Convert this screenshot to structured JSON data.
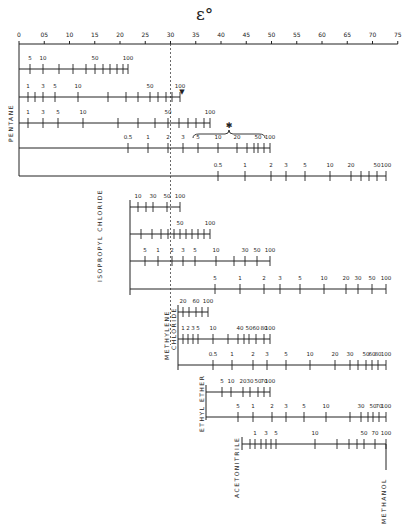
{
  "title": "ε°",
  "axis": {
    "min": 0,
    "max": 0.75,
    "step": 0.05,
    "ticks": [
      "0",
      "05",
      "10",
      "15",
      "20",
      "25",
      "30",
      "35",
      "40",
      "45",
      "50",
      "55",
      "60",
      "65",
      "70",
      "75"
    ],
    "x0_px": 19,
    "px_per_unit": 505,
    "y_px": 44
  },
  "reference_line": {
    "value": 0.3,
    "style": "dashed"
  },
  "solvent_labels": [
    {
      "id": "pentane",
      "text": "PENTANE",
      "x": 7,
      "y": 142
    },
    {
      "id": "isopropyl-chloride",
      "text": "ISOPROPYL  CHLORIDE",
      "x": 96,
      "y": 282
    },
    {
      "id": "methylene-chloride-1",
      "text": "METHYLENE",
      "x": 163,
      "y": 360
    },
    {
      "id": "methylene-chloride-2",
      "text": "CHLORIDE",
      "x": 170,
      "y": 350
    },
    {
      "id": "ethyl-ether",
      "text": "ETHYL  ETHER",
      "x": 198,
      "y": 432
    },
    {
      "id": "acetonitrile",
      "text": "ACETONITRILE",
      "x": 233,
      "y": 498
    },
    {
      "id": "methanol",
      "text": "METHANOL",
      "x": 380,
      "y": 524
    }
  ],
  "scales": [
    {
      "y": 69,
      "x1": 19,
      "x2": 128,
      "labels": [
        [
          "5",
          30
        ],
        [
          "10",
          43
        ],
        [
          "50",
          95
        ],
        [
          "100",
          128
        ]
      ],
      "ticks": [
        30,
        43,
        59,
        73,
        86,
        95,
        103,
        110,
        117,
        123,
        128
      ]
    },
    {
      "y": 97,
      "x1": 19,
      "x2": 180,
      "labels": [
        [
          "1",
          28
        ],
        [
          "3",
          43
        ],
        [
          "5",
          55
        ],
        [
          "10",
          78
        ],
        [
          "50",
          150
        ],
        [
          "100",
          180
        ]
      ],
      "ticks": [
        28,
        35,
        43,
        55,
        78,
        108,
        126,
        138,
        150,
        158,
        166,
        172,
        180
      ]
    },
    {
      "y": 123,
      "x1": 19,
      "x2": 210,
      "labels": [
        [
          "1",
          28
        ],
        [
          "3",
          43
        ],
        [
          "5",
          58
        ],
        [
          "10",
          83
        ],
        [
          "50",
          168
        ],
        [
          "100",
          210
        ]
      ],
      "ticks": [
        28,
        43,
        58,
        83,
        118,
        138,
        155,
        168,
        179,
        188,
        196,
        204,
        210
      ]
    },
    {
      "y": 148,
      "x1": 19,
      "x2": 270,
      "labels": [
        [
          "0.5",
          128
        ],
        [
          "1",
          148
        ],
        [
          "2",
          168
        ],
        [
          "3",
          183
        ],
        [
          "5",
          198
        ],
        [
          "10",
          218
        ],
        [
          "20",
          237
        ],
        [
          "50",
          258
        ],
        [
          "100",
          270
        ]
      ],
      "ticks": [
        128,
        148,
        168,
        183,
        198,
        218,
        237,
        247,
        254,
        258,
        264,
        270
      ],
      "brace": {
        "x1": 193,
        "x2": 265,
        "y": 133,
        "mark": "✱"
      }
    },
    {
      "y": 176,
      "x1": 19,
      "x2": 386,
      "labels": [
        [
          "0.5",
          218
        ],
        [
          "1",
          245
        ],
        [
          "2",
          271
        ],
        [
          "3",
          286
        ],
        [
          "5",
          305
        ],
        [
          "10",
          330
        ],
        [
          "20",
          351
        ],
        [
          "50",
          377
        ],
        [
          "100",
          386
        ]
      ],
      "ticks": [
        218,
        245,
        271,
        286,
        305,
        330,
        351,
        361,
        369,
        377,
        386
      ]
    },
    {
      "y": 207,
      "x1": 130,
      "x2": 180,
      "labels": [
        [
          "10",
          138
        ],
        [
          "30",
          153
        ],
        [
          "50",
          167
        ],
        [
          "100",
          180
        ]
      ],
      "ticks": [
        138,
        146,
        153,
        167,
        180
      ]
    },
    {
      "y": 234,
      "x1": 130,
      "x2": 210,
      "labels": [
        [
          "50",
          180
        ],
        [
          "100",
          210
        ]
      ],
      "ticks": [
        141,
        152,
        161,
        168,
        174,
        180,
        186,
        192,
        198,
        204,
        210
      ]
    },
    {
      "y": 261,
      "x1": 130,
      "x2": 270,
      "labels": [
        [
          "5",
          145
        ],
        [
          "1",
          158
        ],
        [
          "2",
          172
        ],
        [
          "3",
          183
        ],
        [
          "5",
          195
        ],
        [
          "10",
          216
        ],
        [
          "30",
          245
        ],
        [
          "50",
          257
        ],
        [
          "100",
          270
        ]
      ],
      "ticks": [
        145,
        158,
        172,
        183,
        195,
        216,
        234,
        245,
        257,
        270
      ]
    },
    {
      "y": 289,
      "x1": 130,
      "x2": 386,
      "labels": [
        [
          "5",
          215
        ],
        [
          "1",
          240
        ],
        [
          "2",
          264
        ],
        [
          "3",
          280
        ],
        [
          "5",
          300
        ],
        [
          "10",
          324
        ],
        [
          "20",
          346
        ],
        [
          "30",
          358
        ],
        [
          "50",
          372
        ],
        [
          "100",
          386
        ]
      ],
      "ticks": [
        215,
        240,
        264,
        280,
        300,
        324,
        346,
        358,
        372,
        386
      ]
    },
    {
      "y": 312,
      "x1": 178,
      "x2": 208,
      "labels": [
        [
          "20",
          183
        ],
        [
          "60",
          196
        ],
        [
          "100",
          208
        ]
      ],
      "ticks": [
        183,
        189,
        196,
        202,
        208
      ]
    },
    {
      "y": 339,
      "x1": 178,
      "x2": 270,
      "labels": [
        [
          "1",
          183
        ],
        [
          "2",
          188
        ],
        [
          "3",
          193
        ],
        [
          "5",
          198
        ],
        [
          "10",
          213
        ],
        [
          "40",
          240
        ],
        [
          "50",
          249
        ],
        [
          "60",
          256
        ],
        [
          "80",
          264
        ],
        [
          "100",
          270
        ]
      ],
      "ticks": [
        183,
        188,
        193,
        198,
        213,
        228,
        238,
        244,
        249,
        256,
        264,
        270
      ]
    },
    {
      "y": 365,
      "x1": 178,
      "x2": 386,
      "labels": [
        [
          "0.5",
          213
        ],
        [
          "1",
          232
        ],
        [
          "2",
          253
        ],
        [
          "3",
          267
        ],
        [
          "5",
          286
        ],
        [
          "10",
          310
        ],
        [
          "20",
          335
        ],
        [
          "30",
          350
        ],
        [
          "50",
          366
        ],
        [
          "60",
          372
        ],
        [
          "80",
          378
        ],
        [
          "100",
          386
        ]
      ],
      "ticks": [
        213,
        232,
        253,
        267,
        286,
        310,
        335,
        350,
        358,
        366,
        372,
        378,
        386
      ]
    },
    {
      "y": 392,
      "x1": 206,
      "x2": 270,
      "labels": [
        [
          "5",
          222
        ],
        [
          "10",
          231
        ],
        [
          "20",
          243
        ],
        [
          "30",
          250
        ],
        [
          "50",
          258
        ],
        [
          "70",
          264
        ],
        [
          "100",
          270
        ]
      ],
      "ticks": [
        222,
        231,
        243,
        250,
        258,
        264,
        270
      ]
    },
    {
      "y": 417,
      "x1": 206,
      "x2": 386,
      "labels": [
        [
          "5",
          238
        ],
        [
          "1",
          253
        ],
        [
          "2",
          272
        ],
        [
          "3",
          286
        ],
        [
          "5",
          304
        ],
        [
          "10",
          326
        ],
        [
          "30",
          361
        ],
        [
          "50",
          373
        ],
        [
          "70",
          379
        ],
        [
          "100",
          386
        ]
      ],
      "ticks": [
        238,
        253,
        272,
        286,
        304,
        326,
        350,
        361,
        368,
        373,
        379,
        386
      ]
    },
    {
      "y": 444,
      "x1": 242,
      "x2": 386,
      "labels": [
        [
          "1",
          255
        ],
        [
          "3",
          266
        ],
        [
          "5",
          276
        ],
        [
          "10",
          315
        ],
        [
          "50",
          364
        ],
        [
          "70",
          375
        ],
        [
          "100",
          386
        ]
      ],
      "ticks": [
        250,
        255,
        261,
        266,
        271,
        276,
        315,
        337,
        349,
        357,
        364,
        375,
        386
      ]
    }
  ],
  "methanol_stem": {
    "x": 386,
    "y1": 444,
    "y2": 470
  },
  "legend_marker": {
    "symbol": "▼",
    "x": 182,
    "y": 88
  }
}
